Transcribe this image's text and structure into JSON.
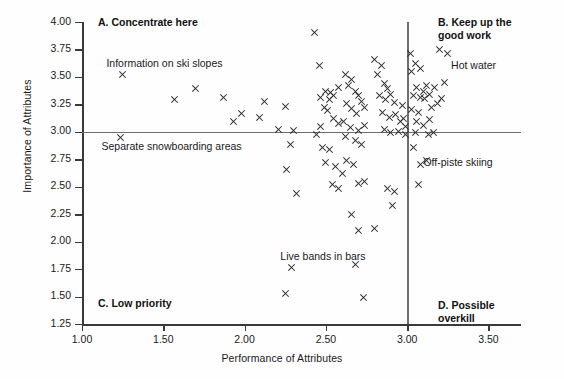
{
  "chart_data": {
    "type": "scatter",
    "title": "",
    "xlabel": "Performance of Attributes",
    "ylabel": "Importance of Attributes",
    "xlim": [
      1.0,
      3.7
    ],
    "ylim": [
      1.25,
      4.0
    ],
    "xticks": [
      "1.00",
      "1.50",
      "2.00",
      "2.50",
      "3.00",
      "3.50"
    ],
    "xtick_values": [
      1.0,
      1.5,
      2.0,
      2.5,
      3.0,
      3.5
    ],
    "yticks": [
      "4.00",
      "3.75",
      "3.50",
      "3.25",
      "3.00",
      "2.75",
      "2.50",
      "2.25",
      "2.00",
      "1.75",
      "1.50",
      "1.25"
    ],
    "ytick_values": [
      4.0,
      3.75,
      3.5,
      3.25,
      3.0,
      2.75,
      2.5,
      2.25,
      2.0,
      1.75,
      1.5,
      1.25
    ],
    "grid": false,
    "legend": "none",
    "marker": "x",
    "marker_color": "#2a2a2a",
    "crosshair_color": "#6e6e6e",
    "crosshair_x": 3.0,
    "crosshair_y": 3.0,
    "quadrants": [
      {
        "key": "A",
        "label": "A. Concentrate here",
        "position": "top-left"
      },
      {
        "key": "B",
        "label": "B. Keep up the\ngood work",
        "position": "top-right"
      },
      {
        "key": "C",
        "label": "C. Low priority",
        "position": "bottom-left"
      },
      {
        "key": "D",
        "label": "D. Possible overkill",
        "position": "bottom-right"
      }
    ],
    "annotations": [
      {
        "text": "Information on ski slopes",
        "x": 1.15,
        "y": 3.62
      },
      {
        "text": "Separate snowboarding areas",
        "x": 1.12,
        "y": 2.86
      },
      {
        "text": "Live bands in bars",
        "x": 2.22,
        "y": 1.86
      },
      {
        "text": "Hot water",
        "x": 3.27,
        "y": 3.6
      },
      {
        "text": "Off-piste skiing",
        "x": 3.1,
        "y": 2.72
      }
    ],
    "points": [
      [
        1.25,
        3.52
      ],
      [
        1.24,
        2.95
      ],
      [
        1.57,
        3.29
      ],
      [
        1.7,
        3.39
      ],
      [
        1.87,
        3.31
      ],
      [
        1.93,
        3.09
      ],
      [
        1.98,
        3.17
      ],
      [
        2.09,
        3.13
      ],
      [
        2.12,
        3.28
      ],
      [
        2.25,
        3.23
      ],
      [
        2.21,
        3.02
      ],
      [
        2.3,
        3.01
      ],
      [
        2.28,
        2.88
      ],
      [
        2.26,
        2.66
      ],
      [
        2.32,
        2.44
      ],
      [
        2.29,
        1.76
      ],
      [
        2.25,
        1.53
      ],
      [
        2.43,
        3.9
      ],
      [
        2.46,
        3.6
      ],
      [
        2.47,
        3.31
      ],
      [
        2.5,
        3.37
      ],
      [
        2.53,
        3.36
      ],
      [
        2.52,
        3.29
      ],
      [
        2.55,
        3.33
      ],
      [
        2.58,
        3.4
      ],
      [
        2.49,
        3.22
      ],
      [
        2.51,
        3.19
      ],
      [
        2.55,
        3.12
      ],
      [
        2.58,
        3.08
      ],
      [
        2.47,
        3.05
      ],
      [
        2.44,
        2.98
      ],
      [
        2.48,
        2.86
      ],
      [
        2.52,
        2.84
      ],
      [
        2.5,
        2.72
      ],
      [
        2.56,
        2.68
      ],
      [
        2.54,
        2.52
      ],
      [
        2.58,
        2.48
      ],
      [
        2.6,
        2.62
      ],
      [
        2.62,
        3.52
      ],
      [
        2.66,
        3.48
      ],
      [
        2.64,
        3.42
      ],
      [
        2.68,
        3.37
      ],
      [
        2.7,
        3.33
      ],
      [
        2.63,
        3.26
      ],
      [
        2.66,
        3.21
      ],
      [
        2.69,
        3.17
      ],
      [
        2.72,
        3.28
      ],
      [
        2.74,
        3.22
      ],
      [
        2.61,
        3.09
      ],
      [
        2.65,
        3.04
      ],
      [
        2.7,
        3.01
      ],
      [
        2.74,
        3.06
      ],
      [
        2.62,
        2.96
      ],
      [
        2.68,
        2.92
      ],
      [
        2.72,
        2.88
      ],
      [
        2.63,
        2.74
      ],
      [
        2.67,
        2.7
      ],
      [
        2.7,
        2.53
      ],
      [
        2.74,
        2.55
      ],
      [
        2.66,
        2.25
      ],
      [
        2.7,
        2.1
      ],
      [
        2.68,
        1.79
      ],
      [
        2.73,
        1.49
      ],
      [
        2.8,
        3.66
      ],
      [
        2.84,
        3.6
      ],
      [
        2.82,
        3.52
      ],
      [
        2.86,
        3.44
      ],
      [
        2.88,
        3.39
      ],
      [
        2.83,
        3.33
      ],
      [
        2.87,
        3.29
      ],
      [
        2.9,
        3.34
      ],
      [
        2.92,
        3.27
      ],
      [
        2.85,
        3.18
      ],
      [
        2.89,
        3.13
      ],
      [
        2.93,
        3.16
      ],
      [
        2.96,
        3.09
      ],
      [
        2.86,
        3.02
      ],
      [
        2.9,
        2.99
      ],
      [
        2.95,
        3.0
      ],
      [
        2.97,
        3.24
      ],
      [
        2.98,
        3.12
      ],
      [
        2.99,
        3.05
      ],
      [
        2.99,
        2.98
      ],
      [
        2.88,
        2.48
      ],
      [
        2.92,
        2.46
      ],
      [
        2.91,
        2.33
      ],
      [
        2.8,
        2.12
      ],
      [
        3.02,
        3.71
      ],
      [
        3.05,
        3.62
      ],
      [
        3.03,
        3.55
      ],
      [
        3.08,
        3.58
      ],
      [
        3.06,
        3.4
      ],
      [
        3.1,
        3.37
      ],
      [
        3.12,
        3.42
      ],
      [
        3.04,
        3.33
      ],
      [
        3.08,
        3.31
      ],
      [
        3.11,
        3.3
      ],
      [
        3.14,
        3.34
      ],
      [
        3.17,
        3.4
      ],
      [
        3.03,
        3.2
      ],
      [
        3.07,
        3.18
      ],
      [
        3.15,
        3.22
      ],
      [
        3.19,
        3.26
      ],
      [
        3.06,
        3.09
      ],
      [
        3.1,
        3.06
      ],
      [
        3.14,
        3.11
      ],
      [
        3.05,
        2.99
      ],
      [
        3.13,
        2.98
      ],
      [
        3.16,
        2.99
      ],
      [
        3.04,
        2.86
      ],
      [
        3.08,
        2.7
      ],
      [
        3.12,
        2.74
      ],
      [
        3.07,
        2.52
      ],
      [
        3.2,
        3.75
      ],
      [
        3.25,
        3.71
      ],
      [
        3.23,
        3.45
      ],
      [
        3.21,
        3.3
      ]
    ]
  }
}
